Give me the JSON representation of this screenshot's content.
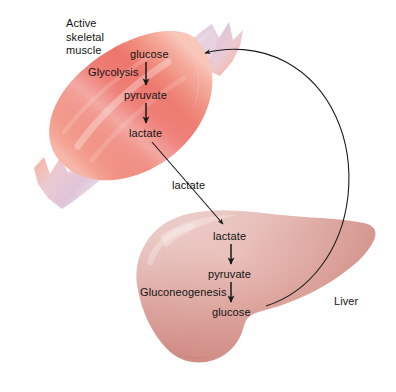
{
  "figure": {
    "background_color": "#ffffff",
    "text_color": "#141414"
  },
  "muscle": {
    "organ_label": "Active\nskeletal\nmuscle",
    "pathway_label": "Glycolysis",
    "metabolites": {
      "glucose": "glucose",
      "pyruvate": "pyruvate",
      "lactate": "lactate"
    },
    "colors": {
      "core": "#e8473b",
      "mid": "#f07a68",
      "highlight": "#fbc9bd",
      "tendon": "#ddc3d6",
      "tendon_light": "#f0e2ee"
    }
  },
  "transport": {
    "lactate_label": "lactate"
  },
  "liver": {
    "organ_label": "Liver",
    "pathway_label": "Gluconeogenesis",
    "metabolites": {
      "lactate": "lactate",
      "pyruvate": "pyruvate",
      "glucose": "glucose"
    },
    "colors": {
      "body": "#d79a94",
      "highlight": "#e6b4ad",
      "shade": "#c98a84",
      "outline": "#7a4038"
    }
  },
  "arrows": {
    "stroke_color": "#1a1a1a",
    "muscle_glucose_to_pyruvate": "vertical-down",
    "muscle_pyruvate_to_lactate": "vertical-down",
    "muscle_lactate_to_liver_lactate": "diagonal-down-right",
    "liver_lactate_to_pyruvate": "vertical-down",
    "liver_pyruvate_to_glucose": "vertical-down",
    "liver_glucose_to_muscle_glucose": "long-curve-right"
  }
}
